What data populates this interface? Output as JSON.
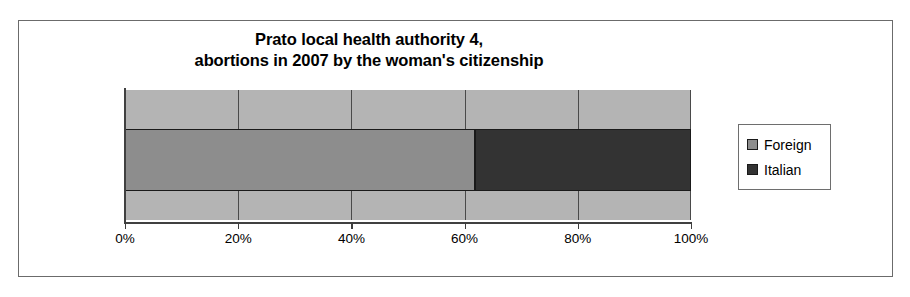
{
  "chart_data": {
    "type": "bar",
    "orientation": "horizontal",
    "stacked": true,
    "normalized_percent": true,
    "title": "Prato local health authority 4, abortions in 2007 by the woman's citizenship",
    "title_lines": [
      "Prato local health authority 4,",
      "abortions in 2007 by the woman's citizenship"
    ],
    "categories": [
      ""
    ],
    "series": [
      {
        "name": "Foreign",
        "values": [
          61.8
        ],
        "color": "#8d8d8d"
      },
      {
        "name": "Italian",
        "values": [
          38.2
        ],
        "color": "#333333"
      }
    ],
    "xlabel": "",
    "ylabel": "",
    "xlim": [
      0,
      100
    ],
    "xticks": [
      0,
      20,
      40,
      60,
      80,
      100
    ],
    "xtick_labels": [
      "0%",
      "20%",
      "40%",
      "60%",
      "80%",
      "100%"
    ],
    "grid": true,
    "grid_axis": "x",
    "legend": {
      "position": "right",
      "entries": [
        {
          "label": "Foreign",
          "color": "#8d8d8d"
        },
        {
          "label": "Italian",
          "color": "#333333"
        }
      ]
    },
    "colors": {
      "plot_background": "#b4b4b4",
      "gridline": "#4a4a4a",
      "axis": "#404040",
      "border": "#6b6b6b",
      "text": "#000000"
    }
  }
}
